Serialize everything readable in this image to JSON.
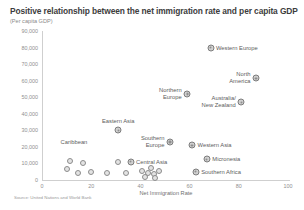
{
  "chart_data": {
    "type": "scatter",
    "title": "Positive relationship between the net immigration rate and per capita GDP",
    "subtitle": "(Per capita GDP)",
    "xlabel": "Net Immigration Rate",
    "ylabel": "",
    "source": "Source: United Nations and World Bank",
    "xlim": [
      0,
      100
    ],
    "ylim": [
      0,
      90000
    ],
    "xticks": [
      "0",
      "20",
      "40",
      "60",
      "80",
      "100"
    ],
    "xtick_values": [
      0,
      20,
      40,
      60,
      80,
      100
    ],
    "yticks": [
      "0",
      "10,000",
      "20,000",
      "30,000",
      "40,000",
      "50,000",
      "60,000",
      "70,000",
      "80,000",
      "90,000"
    ],
    "ytick_values": [
      0,
      10000,
      20000,
      30000,
      40000,
      50000,
      60000,
      70000,
      80000,
      90000
    ],
    "grid": false,
    "legend": "none",
    "marker_color": "#8c8c8c",
    "marker_fill": "#e3e3e3",
    "labeled_points": [
      {
        "label": "Western Europe",
        "x": 68.5,
        "y": 80000,
        "label_pos": "right"
      },
      {
        "label": "North America",
        "x": 87.0,
        "y": 61500,
        "label_pos": "left",
        "lines": [
          "North",
          "America"
        ]
      },
      {
        "label": "Northern Europe",
        "x": 59.0,
        "y": 52000,
        "label_pos": "left",
        "lines": [
          "Northern",
          "Europe"
        ]
      },
      {
        "label": "Australia/ New Zealand",
        "x": 81.0,
        "y": 47000,
        "label_pos": "left",
        "lines": [
          "Australia/",
          "New Zealand"
        ]
      },
      {
        "label": "Eastern Asia",
        "x": 31.0,
        "y": 30000,
        "label_pos": "above"
      },
      {
        "label": "Southern Europe",
        "x": 52.0,
        "y": 23000,
        "label_pos": "left",
        "lines": [
          "Southern",
          "Europe"
        ]
      },
      {
        "label": "Western Asia",
        "x": 61.0,
        "y": 21000,
        "label_pos": "right"
      },
      {
        "label": "Micronesia",
        "x": 67.0,
        "y": 12500,
        "label_pos": "right"
      },
      {
        "label": "Southern Africa",
        "x": 62.5,
        "y": 5000,
        "label_pos": "right"
      },
      {
        "label": "Central Asia",
        "x": 36.0,
        "y": 11000,
        "label_pos": "right"
      },
      {
        "label": "Caribbean",
        "x": 13.0,
        "y": 17500,
        "label_pos": "above",
        "label_only": true
      }
    ],
    "unlabeled_points": [
      {
        "x": 11.5,
        "y": 11500
      },
      {
        "x": 16.5,
        "y": 10500
      },
      {
        "x": 10.0,
        "y": 6500
      },
      {
        "x": 14.5,
        "y": 4500
      },
      {
        "x": 20.0,
        "y": 5000
      },
      {
        "x": 26.5,
        "y": 4000
      },
      {
        "x": 31.0,
        "y": 11000
      },
      {
        "x": 40.5,
        "y": 5500
      },
      {
        "x": 43.0,
        "y": 4500
      },
      {
        "x": 44.5,
        "y": 7000
      },
      {
        "x": 45.5,
        "y": 3500
      },
      {
        "x": 47.5,
        "y": 5500
      },
      {
        "x": 42.0,
        "y": 2000
      },
      {
        "x": 46.0,
        "y": 1500
      },
      {
        "x": 34.0,
        "y": 4500
      }
    ]
  }
}
